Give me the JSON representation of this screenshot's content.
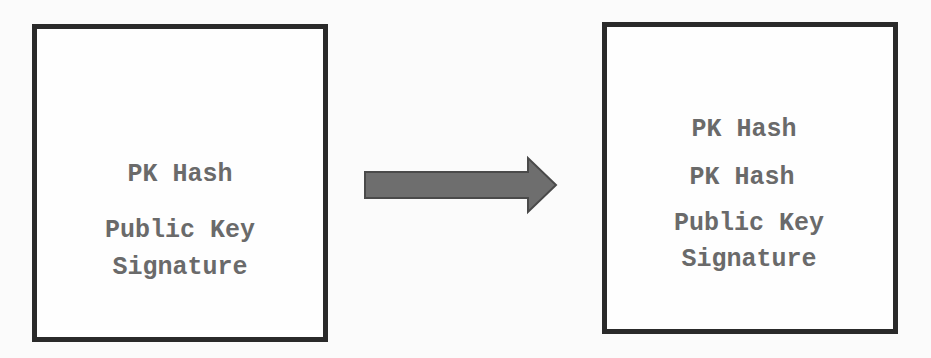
{
  "diagram": {
    "left_box": {
      "lines": [
        "PK Hash",
        "Public Key",
        "Signature"
      ]
    },
    "right_box": {
      "lines": [
        "PK Hash",
        "PK Hash",
        "Public Key",
        "Signature"
      ]
    },
    "arrow": {
      "direction": "right",
      "color": "#6e6e6e",
      "outline": "#4a4a4a"
    }
  }
}
